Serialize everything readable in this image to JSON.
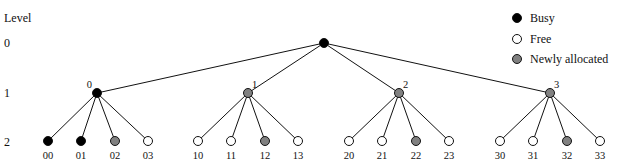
{
  "figure": {
    "level_heading": "Level",
    "levels": [
      {
        "label": "0",
        "y": 43
      },
      {
        "label": "1",
        "y": 93
      },
      {
        "label": "2",
        "y": 141
      }
    ],
    "legend": [
      {
        "label": "Busy",
        "state": "busy"
      },
      {
        "label": "Free",
        "state": "free"
      },
      {
        "label": "Newly allocated",
        "state": "new"
      }
    ],
    "colors": {
      "busy": "#000000",
      "free": "#ffffff",
      "new": "#808080",
      "stroke": "#111111"
    },
    "tree": {
      "root": {
        "x": 324,
        "y": 43,
        "state": "busy"
      },
      "level1": [
        {
          "label": "0",
          "x": 97,
          "y": 93,
          "state": "busy",
          "children": [
            {
              "label": "00",
              "x": 48,
              "state": "busy"
            },
            {
              "label": "01",
              "x": 81,
              "state": "busy"
            },
            {
              "label": "02",
              "x": 115,
              "state": "new"
            },
            {
              "label": "03",
              "x": 148,
              "state": "free"
            }
          ]
        },
        {
          "label": "1",
          "x": 248,
          "y": 93,
          "state": "new",
          "children": [
            {
              "label": "10",
              "x": 198,
              "state": "free"
            },
            {
              "label": "11",
              "x": 231,
              "state": "free"
            },
            {
              "label": "12",
              "x": 265,
              "state": "new"
            },
            {
              "label": "13",
              "x": 298,
              "state": "free"
            }
          ]
        },
        {
          "label": "2",
          "x": 399,
          "y": 93,
          "state": "new",
          "children": [
            {
              "label": "20",
              "x": 349,
              "state": "free"
            },
            {
              "label": "21",
              "x": 382,
              "state": "free"
            },
            {
              "label": "22",
              "x": 416,
              "state": "new"
            },
            {
              "label": "23",
              "x": 449,
              "state": "free"
            }
          ]
        },
        {
          "label": "3",
          "x": 550,
          "y": 93,
          "state": "new",
          "children": [
            {
              "label": "30",
              "x": 500,
              "state": "free"
            },
            {
              "label": "31",
              "x": 533,
              "state": "free"
            },
            {
              "label": "32",
              "x": 567,
              "state": "new"
            },
            {
              "label": "33",
              "x": 600,
              "state": "free"
            }
          ]
        }
      ],
      "leaf_y": 141,
      "leaf_label_y": 159
    }
  }
}
